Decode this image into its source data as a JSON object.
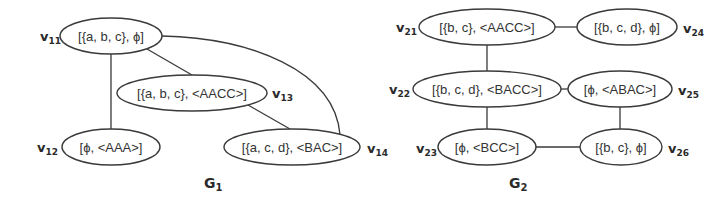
{
  "graphs": [
    {
      "name": "G",
      "sub": "1",
      "nodes": [
        {
          "id": "v11",
          "letter": "v",
          "sub": "11",
          "label": "[{a, b, c}, ϕ]"
        },
        {
          "id": "v12",
          "letter": "v",
          "sub": "12",
          "label": "[ϕ, <AAA>]"
        },
        {
          "id": "v13",
          "letter": "v",
          "sub": "13",
          "label": "[{a, b, c}, <AACC>]"
        },
        {
          "id": "v14",
          "letter": "v",
          "sub": "14",
          "label": "[{a, c, d}, <BAC>]"
        }
      ],
      "edges": [
        [
          "v11",
          "v12"
        ],
        [
          "v11",
          "v13"
        ],
        [
          "v13",
          "v14"
        ],
        [
          "v11",
          "v14"
        ]
      ]
    },
    {
      "name": "G",
      "sub": "2",
      "nodes": [
        {
          "id": "v21",
          "letter": "v",
          "sub": "21",
          "label": "[{b, c}, <AACC>]"
        },
        {
          "id": "v22",
          "letter": "v",
          "sub": "22",
          "label": "[{b, c, d}, <BACC>]"
        },
        {
          "id": "v23",
          "letter": "v",
          "sub": "23",
          "label": "[ϕ, <BCC>]"
        },
        {
          "id": "v24",
          "letter": "v",
          "sub": "24",
          "label": "[{b, c, d}, ϕ]"
        },
        {
          "id": "v25",
          "letter": "v",
          "sub": "25",
          "label": "[ϕ, <ABAC>]"
        },
        {
          "id": "v26",
          "letter": "v",
          "sub": "26",
          "label": "[{b, c}, ϕ]"
        }
      ],
      "edges": [
        [
          "v21",
          "v24"
        ],
        [
          "v21",
          "v22"
        ],
        [
          "v22",
          "v25"
        ],
        [
          "v22",
          "v23"
        ],
        [
          "v25",
          "v26"
        ],
        [
          "v23",
          "v26"
        ]
      ]
    }
  ]
}
